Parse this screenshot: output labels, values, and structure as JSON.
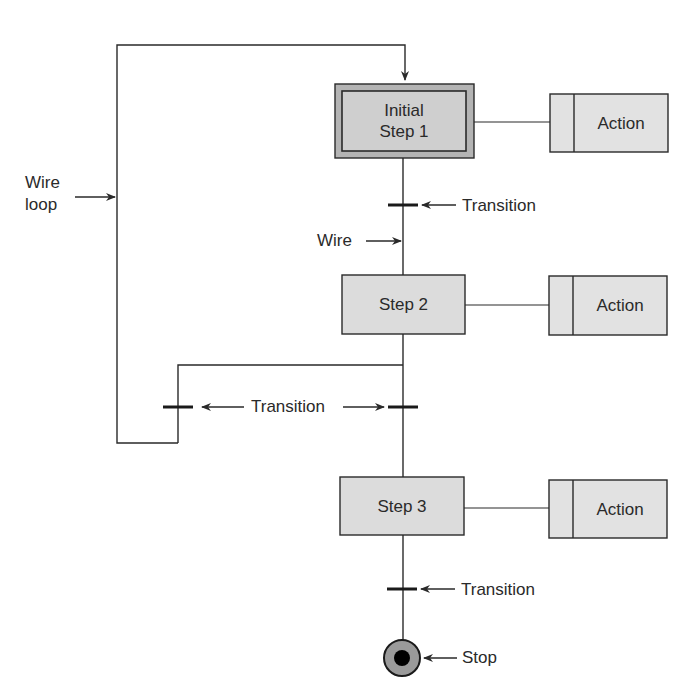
{
  "diagram": {
    "type": "sequential-function-chart",
    "colors": {
      "line": "#2a2a2a",
      "step_fill": "#dcdcdc",
      "initial_outer_fill": "#b4b4b4",
      "initial_inner_fill": "#cfcfcf",
      "action_fill": "#e2e2e2",
      "stop_ring": "#9a9a9a",
      "stop_core": "#000000"
    },
    "steps": [
      {
        "id": "initial",
        "line1": "Initial",
        "line2": "Step 1"
      },
      {
        "id": "step2",
        "label": "Step 2"
      },
      {
        "id": "step3",
        "label": "Step 3"
      }
    ],
    "actions": [
      {
        "label": "Action"
      },
      {
        "label": "Action"
      },
      {
        "label": "Action"
      }
    ],
    "labels": {
      "wire_loop_line1": "Wire",
      "wire_loop_line2": "loop",
      "wire": "Wire",
      "transition_1": "Transition",
      "transition_branch": "Transition",
      "transition_3": "Transition",
      "stop": "Stop"
    }
  }
}
